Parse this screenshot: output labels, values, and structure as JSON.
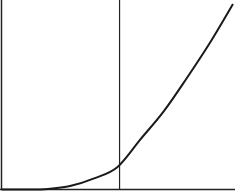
{
  "chart_data": {
    "type": "line",
    "title": "",
    "xlabel": "",
    "ylabel": "",
    "grid": false,
    "legend": null,
    "x": [
      0.0,
      0.1,
      0.2,
      0.3,
      0.4,
      0.5,
      0.6,
      0.7,
      0.8,
      0.9,
      1.0
    ],
    "series": [
      {
        "name": "curve",
        "values": [
          0.0,
          0.0,
          0.003,
          0.02,
          0.06,
          0.12,
          0.27,
          0.42,
          0.6,
          0.79,
          1.0
        ]
      }
    ],
    "xlim": [
      0,
      1
    ],
    "ylim": [
      0,
      1
    ],
    "annotations": [
      {
        "type": "vertical-line",
        "x": 0.51
      }
    ],
    "colors": {
      "line": "#1a1a1a",
      "axis": "#222222",
      "background": "#ffffff"
    }
  }
}
